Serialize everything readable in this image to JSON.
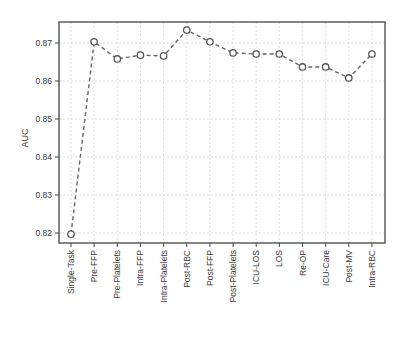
{
  "chart_data": {
    "type": "line",
    "title": "",
    "xlabel": "",
    "ylabel": "AUC",
    "ylim": [
      0.818,
      0.876
    ],
    "yticks": [
      0.82,
      0.83,
      0.84,
      0.85,
      0.86,
      0.87
    ],
    "ytick_labels": [
      "0.82",
      "0.83",
      "0.84",
      "0.85",
      "0.86",
      "0.87"
    ],
    "grid": true,
    "legend": null,
    "categories": [
      "Single-Task",
      "Pre-FFP",
      "Pre-Platelets",
      "Intra-FFP",
      "Intra-Platelets",
      "Post-RBC",
      "Post-FFP",
      "Post-Platelets",
      "ICU-LOS",
      "LOS",
      "Re-OP",
      "ICU-Care",
      "Post-MV",
      "Intra-RBC"
    ],
    "series": [
      {
        "name": "AUC",
        "style": "dashed line with open circle markers",
        "values": [
          0.8197,
          0.8703,
          0.8658,
          0.8668,
          0.8666,
          0.8734,
          0.8703,
          0.8674,
          0.8671,
          0.8671,
          0.8637,
          0.8637,
          0.8608,
          0.8671
        ]
      }
    ]
  },
  "colors": {
    "line": "#666666",
    "marker_edge": "#555555",
    "frame": "#444444",
    "grid": "#d6d6d6"
  }
}
